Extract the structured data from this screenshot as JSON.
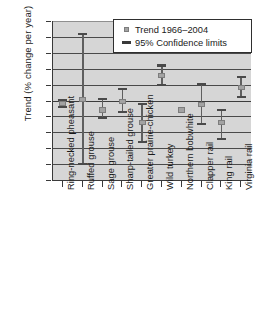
{
  "chart_data": {
    "type": "scatter",
    "title": "",
    "xlabel": "",
    "ylabel": "Trend (% change per year)",
    "ylim": [
      -25,
      25
    ],
    "yticks": [
      25,
      20,
      15,
      10,
      5,
      0,
      -5,
      -10,
      -15,
      -20,
      -25
    ],
    "ytick_labels": [
      "25",
      "20",
      "15",
      "10",
      "5",
      "0",
      "−5",
      "−10",
      "−15",
      "−20",
      "−25"
    ],
    "grid": true,
    "grid_axis": "y",
    "legend_position": "top-right",
    "legend": [
      {
        "label": "Trend 1966–2004",
        "marker": "square",
        "color": "#a3a3a3"
      },
      {
        "label": "95% Confidence limits",
        "marker": "line",
        "color": "#3a3a3a"
      }
    ],
    "categories": [
      "Ring-necked pheasant",
      "Ruffed grouse",
      "Sage grouse",
      "Sharp-tailed grouse",
      "Greater prairie-chicken",
      "Wild turkey",
      "Northern bobwhite",
      "Clapper rail",
      "King rail",
      "Virginia rail"
    ],
    "series": [
      {
        "name": "Trend 1966–2004",
        "values": [
          -1.0,
          0.3,
          -3.0,
          -0.2,
          -7.0,
          7.8,
          -3.0,
          -1.2,
          -7.0,
          4.0
        ]
      },
      {
        "name": "95% Confidence limits (upper)",
        "values": [
          0.0,
          21.0,
          0.5,
          3.5,
          -1.0,
          11.0,
          null,
          5.3,
          -3.0,
          7.5
        ]
      },
      {
        "name": "95% Confidence limits (lower)",
        "values": [
          -2.0,
          -20.0,
          -5.5,
          -3.5,
          -13.0,
          5.0,
          null,
          -7.5,
          -12.0,
          1.0
        ]
      }
    ],
    "points": [
      {
        "category": "Ring-necked pheasant",
        "trend": -1.0,
        "ci_upper": 0.0,
        "ci_lower": -2.0
      },
      {
        "category": "Ruffed grouse",
        "trend": 0.3,
        "ci_upper": 21.0,
        "ci_lower": -20.0
      },
      {
        "category": "Sage grouse",
        "trend": -3.0,
        "ci_upper": 0.5,
        "ci_lower": -5.5
      },
      {
        "category": "Sharp-tailed grouse",
        "trend": -0.2,
        "ci_upper": 3.5,
        "ci_lower": -3.5
      },
      {
        "category": "Greater prairie-chicken",
        "trend": -7.0,
        "ci_upper": -1.0,
        "ci_lower": -13.0
      },
      {
        "category": "Wild turkey",
        "trend": 7.8,
        "ci_upper": 11.0,
        "ci_lower": 5.0
      },
      {
        "category": "Northern bobwhite",
        "trend": -3.0,
        "ci_upper": null,
        "ci_lower": null
      },
      {
        "category": "Clapper rail",
        "trend": -1.2,
        "ci_upper": 5.3,
        "ci_lower": -7.5
      },
      {
        "category": "King rail",
        "trend": -7.0,
        "ci_upper": -3.0,
        "ci_lower": -12.0
      },
      {
        "category": "Virginia rail",
        "trend": 4.0,
        "ci_upper": 7.5,
        "ci_lower": 1.0
      }
    ],
    "colors": {
      "plot_background": "#d6d6d6",
      "gridline": "#4a4a4a",
      "marker": "#a3a3a3",
      "whisker": "#4a4a4a",
      "axis": "#3a3a3a",
      "legend_background": "#ffffff"
    }
  }
}
